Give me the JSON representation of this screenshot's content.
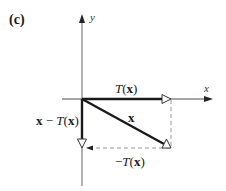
{
  "panel_label": "(c)",
  "axes": {
    "x_label": "x",
    "y_label": "y"
  },
  "vectors": {
    "x": {
      "label": "x"
    },
    "t_x": {
      "label_fn": "T",
      "label_open": "(",
      "label_arg": "x",
      "label_close": ")"
    },
    "x_minus_t": {
      "label_arg1": "x",
      "label_minus": " − ",
      "label_fn": "T",
      "label_open": "(",
      "label_arg": "x",
      "label_close": ")"
    },
    "neg_t": {
      "label_minus": "−",
      "label_fn": "T",
      "label_open": "(",
      "label_arg": "x",
      "label_close": ")"
    }
  },
  "colors": {
    "axis": "#888888",
    "vector": "#1a1a1a",
    "dashed": "#999999"
  }
}
